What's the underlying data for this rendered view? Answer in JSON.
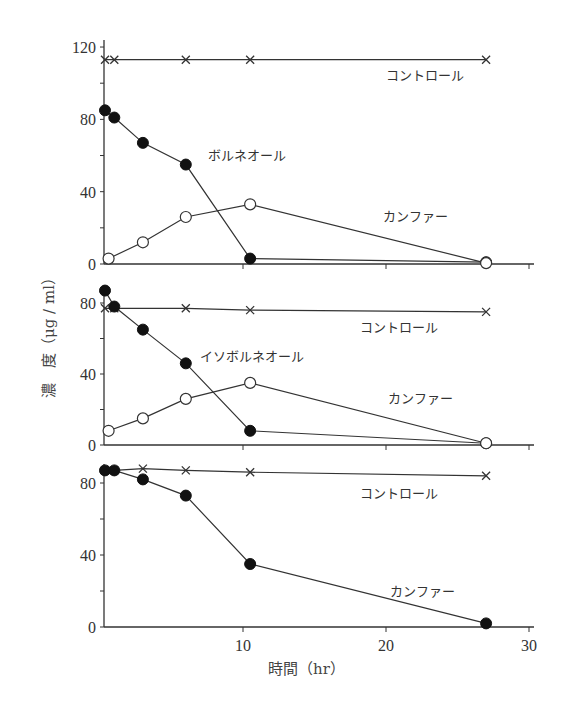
{
  "chart_data": [
    {
      "type": "line",
      "panel": 1,
      "ylim": [
        0,
        120
      ],
      "yticks": [
        0,
        40,
        80,
        120
      ],
      "xlim": [
        0,
        30
      ],
      "series": [
        {
          "name": "コントロール",
          "marker": "x",
          "x": [
            0.3,
            1,
            6,
            10.5,
            27
          ],
          "values": [
            113,
            113,
            113,
            113,
            113
          ]
        },
        {
          "name": "ボルネオール",
          "marker": "filled-circle",
          "x": [
            0.3,
            1,
            3,
            6,
            10.5,
            27
          ],
          "values": [
            85,
            81,
            67,
            55,
            3,
            1
          ]
        },
        {
          "name": "カンファー",
          "marker": "open-circle",
          "x": [
            0.6,
            3,
            6,
            10.5,
            27
          ],
          "values": [
            3,
            12,
            26,
            33,
            0.5
          ]
        }
      ],
      "labels": [
        {
          "text": "コントロール",
          "x": 386,
          "y": 80
        },
        {
          "text": "ボルネオール",
          "x": 208,
          "y": 160
        },
        {
          "text": "カンファー",
          "x": 383,
          "y": 221
        }
      ]
    },
    {
      "type": "line",
      "panel": 2,
      "ylim": [
        0,
        90
      ],
      "yticks": [
        0,
        40,
        80
      ],
      "xlim": [
        0,
        30
      ],
      "series": [
        {
          "name": "コントロール",
          "marker": "x",
          "x": [
            0,
            1,
            6,
            10.5,
            27
          ],
          "values": [
            77,
            77,
            77,
            76,
            75
          ]
        },
        {
          "name": "イソボルネオール",
          "marker": "filled-circle",
          "x": [
            0,
            1,
            3,
            6,
            10.5,
            27
          ],
          "values": [
            87,
            78,
            65,
            46,
            8,
            1
          ]
        },
        {
          "name": "カンファー",
          "marker": "open-circle",
          "x": [
            0.6,
            3,
            6,
            10.5,
            27
          ],
          "values": [
            8,
            15,
            26,
            35,
            1
          ]
        }
      ],
      "labels": [
        {
          "text": "コントロール",
          "x": 360,
          "y": 332
        },
        {
          "text": "イソボルネオール",
          "x": 200,
          "y": 361
        },
        {
          "text": "カンファー",
          "x": 388,
          "y": 403
        }
      ]
    },
    {
      "type": "line",
      "panel": 3,
      "ylim": [
        0,
        90
      ],
      "yticks": [
        0,
        40,
        80
      ],
      "xlim": [
        0,
        30
      ],
      "xticks": [
        10,
        20,
        30
      ],
      "series": [
        {
          "name": "コントロール",
          "marker": "x",
          "x": [
            0,
            1,
            3,
            6,
            10.5,
            27
          ],
          "values": [
            87,
            87,
            88,
            87,
            86,
            84
          ]
        },
        {
          "name": "カンファー",
          "marker": "filled-circle",
          "x": [
            0,
            1,
            3,
            6,
            10.5,
            27
          ],
          "values": [
            87,
            87,
            82,
            73,
            35,
            2
          ]
        }
      ],
      "labels": [
        {
          "text": "コントロール",
          "x": 360,
          "y": 498
        },
        {
          "text": "カンファー",
          "x": 390,
          "y": 596
        }
      ]
    }
  ],
  "axes": {
    "xlabel": "時間（hr）",
    "ylabel": "濃　度（μg / ml）",
    "xtick_labels": [
      "10",
      "20",
      "30"
    ]
  },
  "colors": {
    "line": "#333333",
    "marker_fill": "#111111",
    "open_marker_fill": "#ffffff"
  }
}
